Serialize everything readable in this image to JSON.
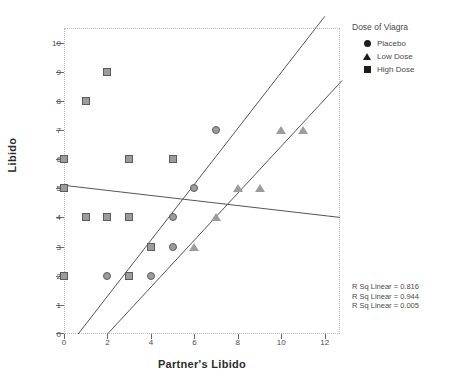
{
  "chart_data": {
    "type": "scatter",
    "title": "",
    "xlabel": "Partner's Libido",
    "ylabel": "Libido",
    "xlim": [
      0,
      12.7
    ],
    "ylim": [
      0,
      10.5
    ],
    "xticks": [
      0,
      2,
      4,
      6,
      8,
      10,
      12
    ],
    "yticks": [
      0,
      1,
      2,
      3,
      4,
      5,
      6,
      7,
      8,
      9,
      10
    ],
    "grid": false,
    "legend_position": "top-right",
    "legend_title": "Dose of Viagra",
    "series": [
      {
        "name": "Placebo",
        "marker": "circle",
        "color": "#9c9c9c",
        "points": [
          [
            2,
            2
          ],
          [
            4,
            2
          ],
          [
            5,
            3
          ],
          [
            5,
            4
          ],
          [
            6,
            5
          ],
          [
            7,
            7
          ]
        ],
        "fit": {
          "x0": 0.65,
          "y0": 0,
          "x1": 12.0,
          "y1": 10.9,
          "r_sq_linear": 0.816
        }
      },
      {
        "name": "Low Dose",
        "marker": "triangle",
        "color": "#9c9c9c",
        "points": [
          [
            6,
            3
          ],
          [
            7,
            4
          ],
          [
            8,
            5
          ],
          [
            9,
            5
          ],
          [
            10,
            7
          ],
          [
            11,
            7
          ]
        ],
        "fit": {
          "x0": 2.0,
          "y0": 0,
          "x1": 12.8,
          "y1": 8.7,
          "r_sq_linear": 0.944
        }
      },
      {
        "name": "High Dose",
        "marker": "square",
        "color": "#9c9c9c",
        "points": [
          [
            0,
            2
          ],
          [
            3,
            2
          ],
          [
            1,
            4
          ],
          [
            2,
            4
          ],
          [
            3,
            4
          ],
          [
            0,
            5
          ],
          [
            0,
            6
          ],
          [
            3,
            6
          ],
          [
            5,
            6
          ],
          [
            1,
            8
          ],
          [
            2,
            9
          ],
          [
            4,
            3
          ]
        ],
        "fit": {
          "x0": 0,
          "y0": 5.1,
          "x1": 12.7,
          "y1": 4.0,
          "r_sq_linear": 0.005
        }
      }
    ],
    "annotations": [
      "R Sq Linear = 0.816",
      "R Sq Linear = 0.944",
      "R Sq Linear = 0.005"
    ]
  },
  "legend": {
    "title": "Dose of Viagra",
    "items": [
      {
        "label": "Placebo",
        "marker": "circle"
      },
      {
        "label": "Low Dose",
        "marker": "triangle"
      },
      {
        "label": "High Dose",
        "marker": "square"
      }
    ]
  },
  "rsq_lines": [
    "R Sq Linear = 0.816",
    "R Sq Linear = 0.944",
    "R Sq Linear = 0.005"
  ],
  "axes": {
    "x_title": "Partner's Libido",
    "y_title": "Libido",
    "x_tick_labels": [
      "0",
      "2",
      "4",
      "6",
      "8",
      "10",
      "12"
    ],
    "y_tick_labels": [
      "0",
      "1",
      "2",
      "3",
      "4",
      "5",
      "6",
      "7",
      "8",
      "9",
      "10"
    ]
  },
  "colors": {
    "marker_fill": "#9c9c9c",
    "marker_stroke": "#5c5c5c",
    "fit_line": "#555555",
    "axis_text": "#4a4a4a"
  }
}
